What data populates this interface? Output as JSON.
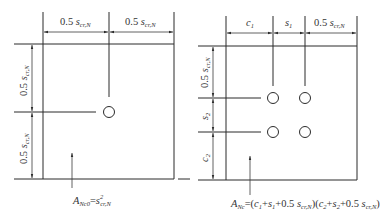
{
  "figures": [
    {
      "name": "single-anchor",
      "top_dims": [
        {
          "coef": "0.5",
          "sym": "s",
          "sub": "cr,N"
        },
        {
          "coef": "0.5",
          "sym": "s",
          "sub": "cr,N"
        }
      ],
      "left_dims": [
        {
          "coef": "0.5",
          "sym": "s",
          "sub": "cr,N"
        },
        {
          "coef": "0.5",
          "sym": "s",
          "sub": "cr,N"
        }
      ],
      "area_label": {
        "lhs": "A",
        "lhs_sub": "Nc0",
        "eq": "=",
        "rhs": "s",
        "rhs_sup": "2",
        "rhs_sub": "cr,N"
      }
    },
    {
      "name": "anchor-group",
      "top_dims": [
        {
          "sym": "c",
          "sub": "1"
        },
        {
          "sym": "s",
          "sub": "1"
        },
        {
          "coef": "0.5",
          "sym": "s",
          "sub": "cr,N"
        }
      ],
      "left_dims": [
        {
          "coef": "0.5",
          "sym": "s",
          "sub": "cr,N"
        },
        {
          "sym": "s",
          "sub": "2"
        },
        {
          "sym": "c",
          "sub": "2"
        }
      ],
      "area_label": {
        "lhs": "A",
        "lhs_sub": "Nc",
        "eq": "=(",
        "t1": "c",
        "t1_sub": "1",
        "p1": "+",
        "t2": "s",
        "t2_sub": "1",
        "p2": "+0.5 ",
        "t3": "s",
        "t3_sub": "cr,N",
        "mid": ")(",
        "t4": "c",
        "t4_sub": "2",
        "p3": "+",
        "t5": "s",
        "t5_sub": "2",
        "p4": "+0.5 ",
        "t6": "s",
        "t6_sub": "cr,N",
        "end": ")"
      }
    }
  ]
}
